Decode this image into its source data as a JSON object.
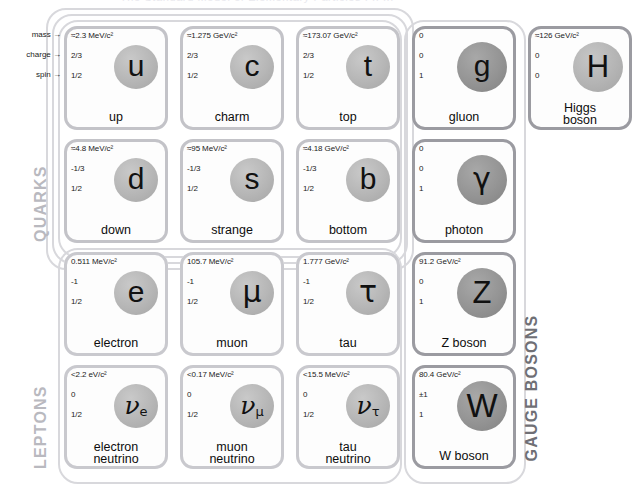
{
  "top_strip_ghost": "The Standard Model of Elementary Particles   I   II   III",
  "annotations": [
    {
      "label": "mass →"
    },
    {
      "label": "charge →"
    },
    {
      "label": "spin →"
    }
  ],
  "family_labels": [
    {
      "text": "QUARKS",
      "tone": "light"
    },
    {
      "text": "LEPTONS",
      "tone": "light"
    },
    {
      "text": "GAUGE BOSONS",
      "tone": "dark"
    }
  ],
  "particles": [
    {
      "id": "up",
      "kind": "quark",
      "symbol": "u",
      "sym_class": "sym-lg",
      "mass": "≈2.3 MeV/c²",
      "charge": "2/3",
      "spin": "1/2",
      "name_line1": "up",
      "name_line2": ""
    },
    {
      "id": "charm",
      "kind": "quark",
      "symbol": "c",
      "sym_class": "sym-lg",
      "mass": "≈1.275 GeV/c²",
      "charge": "2/3",
      "spin": "1/2",
      "name_line1": "charm",
      "name_line2": ""
    },
    {
      "id": "top",
      "kind": "quark",
      "symbol": "t",
      "sym_class": "sym-lg",
      "mass": "≈173.07 GeV/c²",
      "charge": "2/3",
      "spin": "1/2",
      "name_line1": "top",
      "name_line2": ""
    },
    {
      "id": "gluon",
      "kind": "boson",
      "symbol": "g",
      "sym_class": "sym-lg",
      "mass": "0",
      "charge": "0",
      "spin": "1",
      "name_line1": "gluon",
      "name_line2": ""
    },
    {
      "id": "higgs",
      "kind": "boson-higgs",
      "symbol": "H",
      "sym_class": "sym-bold",
      "mass": "≈126 GeV/c²",
      "charge": "0",
      "spin": "0",
      "name_line1": "Higgs",
      "name_line2": "boson"
    },
    {
      "id": "down",
      "kind": "quark",
      "symbol": "d",
      "sym_class": "sym-lg",
      "mass": "≈4.8 MeV/c²",
      "charge": "-1/3",
      "spin": "1/2",
      "name_line1": "down",
      "name_line2": ""
    },
    {
      "id": "strange",
      "kind": "quark",
      "symbol": "s",
      "sym_class": "sym-lg",
      "mass": "≈95 MeV/c²",
      "charge": "-1/3",
      "spin": "1/2",
      "name_line1": "strange",
      "name_line2": ""
    },
    {
      "id": "bottom",
      "kind": "quark",
      "symbol": "b",
      "sym_class": "sym-lg",
      "mass": "≈4.18 GeV/c²",
      "charge": "-1/3",
      "spin": "1/2",
      "name_line1": "bottom",
      "name_line2": ""
    },
    {
      "id": "photon",
      "kind": "boson",
      "symbol": "γ",
      "sym_class": "sym-gr",
      "mass": "0",
      "charge": "0",
      "spin": "1",
      "name_line1": "photon",
      "name_line2": ""
    },
    {
      "id": "electron",
      "kind": "lepton",
      "symbol": "e",
      "sym_class": "sym-lg",
      "mass": "0.511 MeV/c²",
      "charge": "-1",
      "spin": "1/2",
      "name_line1": "electron",
      "name_line2": ""
    },
    {
      "id": "muon",
      "kind": "lepton",
      "symbol": "μ",
      "sym_class": "sym-gr",
      "mass": "105.7 MeV/c²",
      "charge": "-1",
      "spin": "1/2",
      "name_line1": "muon",
      "name_line2": ""
    },
    {
      "id": "tau",
      "kind": "lepton",
      "symbol": "τ",
      "sym_class": "sym-gr",
      "mass": "1.777 GeV/c²",
      "charge": "-1",
      "spin": "1/2",
      "name_line1": "tau",
      "name_line2": ""
    },
    {
      "id": "z-boson",
      "kind": "boson",
      "symbol": "Z",
      "sym_class": "sym-bold",
      "mass": "91.2 GeV/c²",
      "charge": "0",
      "spin": "1",
      "name_line1": "Z boson",
      "name_line2": ""
    },
    {
      "id": "electron-neutrino",
      "kind": "lepton",
      "symbol": "ν",
      "subscript": "e",
      "sym_class": "sym-nu",
      "mass": "<2.2 eV/c²",
      "charge": "0",
      "spin": "1/2",
      "name_line1": "electron",
      "name_line2": "neutrino"
    },
    {
      "id": "muon-neutrino",
      "kind": "lepton",
      "symbol": "ν",
      "subscript": "μ",
      "sym_class": "sym-nu",
      "mass": "<0.17 MeV/c²",
      "charge": "0",
      "spin": "1/2",
      "name_line1": "muon",
      "name_line2": "neutrino"
    },
    {
      "id": "tau-neutrino",
      "kind": "lepton",
      "symbol": "ν",
      "subscript": "τ",
      "sym_class": "sym-nu",
      "mass": "<15.5 MeV/c²",
      "charge": "0",
      "spin": "1/2",
      "name_line1": "tau",
      "name_line2": "neutrino"
    },
    {
      "id": "w-boson",
      "kind": "boson",
      "symbol": "W",
      "sym_class": "sym-bold-lg",
      "mass": "80.4 GeV/c²",
      "charge": "±1",
      "spin": "1",
      "name_line1": "W boson",
      "name_line2": ""
    }
  ],
  "colors": {
    "quark_border": "#c3c3c8",
    "lepton_border": "#c9c9ce",
    "boson_border": "#9b9ba1",
    "family_label_light": "#b9b9bf",
    "family_label_dark": "#6f6f75",
    "text": "#0d0d0d"
  }
}
